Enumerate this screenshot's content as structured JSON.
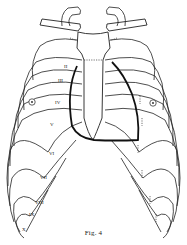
{
  "figure": {
    "caption": "Fig. 4",
    "colors": {
      "line": "#222222",
      "heart_outline": "#111111",
      "background": "#ffffff"
    },
    "rib_labels_left": [
      {
        "label": "II",
        "x": 64,
        "y": 68
      },
      {
        "label": "III",
        "x": 58,
        "y": 82
      },
      {
        "label": "IV",
        "x": 55,
        "y": 104
      },
      {
        "label": "V",
        "x": 50,
        "y": 126
      },
      {
        "label": "VI",
        "x": 49,
        "y": 155
      },
      {
        "label": "VII",
        "x": 40,
        "y": 179
      },
      {
        "label": "VIII",
        "x": 35,
        "y": 204
      },
      {
        "label": "IX",
        "x": 29,
        "y": 216
      },
      {
        "label": "X",
        "x": 22,
        "y": 231
      }
    ],
    "nipple_markers": [
      {
        "side": "left",
        "x": 32,
        "y": 102
      },
      {
        "side": "right",
        "x": 153,
        "y": 103
      }
    ]
  }
}
